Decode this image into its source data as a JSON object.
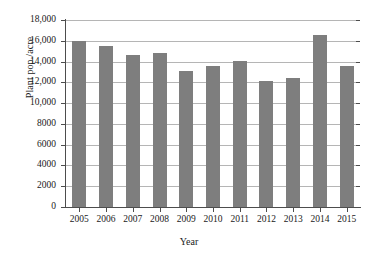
{
  "chart_data": {
    "type": "bar",
    "title": "",
    "xlabel": "Year",
    "ylabel": "Plant pop./acre",
    "categories": [
      "2005",
      "2006",
      "2007",
      "2008",
      "2009",
      "2010",
      "2011",
      "2012",
      "2013",
      "2014",
      "2015"
    ],
    "values": [
      15950,
      15500,
      14600,
      14850,
      13050,
      13550,
      14100,
      12100,
      12450,
      16600,
      13600
    ],
    "ylim": [
      0,
      18000
    ],
    "ytick_values": [
      0,
      2000,
      4000,
      6000,
      8000,
      10000,
      12000,
      14000,
      16000,
      18000
    ],
    "ytick_labels": [
      "0",
      "2000",
      "4000",
      "6000",
      "8000",
      "10,000",
      "12,000",
      "14,000",
      "16,000",
      "18,000"
    ],
    "grid": true,
    "grid_axis": "y",
    "legend": "none",
    "bar_color": "#7e7e7e",
    "grid_color": "#b5b5b5",
    "axis_color": "#4d4d4d",
    "background_color": "#ffffff"
  }
}
